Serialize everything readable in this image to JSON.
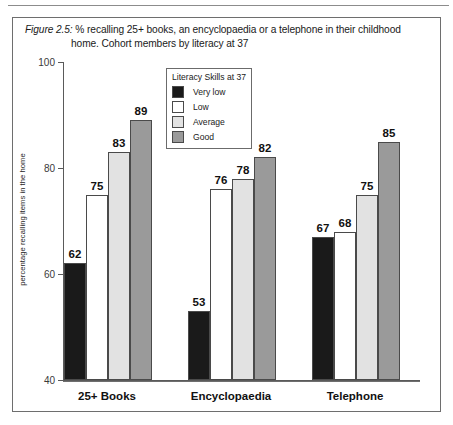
{
  "figure": {
    "label": "Figure 2.5:",
    "caption_line1": " % recalling 25+ books, an encyclopaedia or a telephone in their childhood",
    "caption_line2": "home. Cohort members by literacy at 37"
  },
  "legend": {
    "title": "Literacy Skills at 37",
    "entries": [
      {
        "label": "Very low",
        "color": "#1a1a1a"
      },
      {
        "label": "Low",
        "color": "#ffffff"
      },
      {
        "label": "Average",
        "color": "#e2e2e2"
      },
      {
        "label": "Good",
        "color": "#9a9a9a"
      }
    ]
  },
  "chart_data": {
    "type": "bar",
    "title": "Figure 2.5: % recalling 25+ books, an encyclopaedia or a telephone in their childhood home. Cohort members by literacy at 37",
    "xlabel": "",
    "ylabel": "percentage recalling items in the home",
    "ylim": [
      40,
      100
    ],
    "yticks": [
      40,
      60,
      80,
      100
    ],
    "grid": false,
    "legend_position": "inside-top-center",
    "legend_title": "Literacy Skills at 37",
    "categories": [
      "25+ Books",
      "Encyclopaedia",
      "Telephone"
    ],
    "series": [
      {
        "name": "Very low",
        "color": "#1a1a1a",
        "values": [
          62,
          53,
          67
        ]
      },
      {
        "name": "Low",
        "color": "#ffffff",
        "values": [
          75,
          76,
          68
        ]
      },
      {
        "name": "Average",
        "color": "#e2e2e2",
        "values": [
          83,
          78,
          75
        ]
      },
      {
        "name": "Good",
        "color": "#9a9a9a",
        "values": [
          89,
          82,
          85
        ]
      }
    ]
  }
}
